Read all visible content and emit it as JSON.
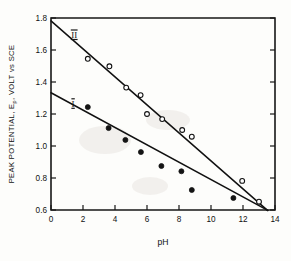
{
  "figure": {
    "background": "#fdfdfb",
    "ink_color": "#111111"
  },
  "chart_data": {
    "type": "scatter",
    "title": "",
    "xlabel": "pH",
    "ylabel": "PEAK POTENTIAL, Ep, VOLT vs SCE",
    "ylabel_main": "PEAK POTENTIAL, E",
    "ylabel_subscript": "p",
    "ylabel_tail": ", VOLT vs SCE",
    "xlim": [
      0,
      14
    ],
    "ylim": [
      0.6,
      1.8
    ],
    "xticks": [
      0,
      2,
      4,
      6,
      8,
      10,
      12,
      14
    ],
    "xticklabels": [
      "0",
      "2",
      "4",
      "6",
      "8",
      "10",
      "12",
      "14"
    ],
    "yticks": [
      0.6,
      0.8,
      1.0,
      1.2,
      1.4,
      1.6,
      1.8
    ],
    "yticklabels": [
      "0.6",
      "0.8",
      "1.0",
      "1.2",
      "1.4",
      "1.6",
      "1.8"
    ],
    "grid": false,
    "legend_position": "inline-annotation",
    "series": [
      {
        "name": "II",
        "label": "II",
        "marker": "open-circle",
        "marker_color": "#ffffff",
        "edge_color": "#111111",
        "label_position": {
          "pH": 1.45,
          "Ep": 1.675
        },
        "fit_line": {
          "intercept": 1.782,
          "slope": -0.0875,
          "x_start": 0.0,
          "x_end": 13.55
        },
        "points": [
          {
            "pH": 2.3,
            "Ep": 1.545
          },
          {
            "pH": 3.65,
            "Ep": 1.498
          },
          {
            "pH": 4.7,
            "Ep": 1.365
          },
          {
            "pH": 5.6,
            "Ep": 1.318
          },
          {
            "pH": 6.0,
            "Ep": 1.2
          },
          {
            "pH": 6.95,
            "Ep": 1.168
          },
          {
            "pH": 8.2,
            "Ep": 1.1
          },
          {
            "pH": 8.8,
            "Ep": 1.058
          },
          {
            "pH": 11.95,
            "Ep": 0.782
          },
          {
            "pH": 13.0,
            "Ep": 0.652
          }
        ]
      },
      {
        "name": "I",
        "label": "I",
        "marker": "filled-circle",
        "marker_color": "#141414",
        "edge_color": "#141414",
        "label_position": {
          "pH": 1.38,
          "Ep": 1.245
        },
        "fit_line": {
          "intercept": 1.333,
          "slope": -0.0543,
          "x_start": 0.0,
          "x_end": 13.55
        },
        "points": [
          {
            "pH": 2.3,
            "Ep": 1.243
          },
          {
            "pH": 3.6,
            "Ep": 1.112
          },
          {
            "pH": 4.65,
            "Ep": 1.038
          },
          {
            "pH": 5.62,
            "Ep": 0.962
          },
          {
            "pH": 6.9,
            "Ep": 0.875
          },
          {
            "pH": 8.15,
            "Ep": 0.842
          },
          {
            "pH": 8.8,
            "Ep": 0.725
          },
          {
            "pH": 11.4,
            "Ep": 0.675
          }
        ]
      }
    ]
  }
}
